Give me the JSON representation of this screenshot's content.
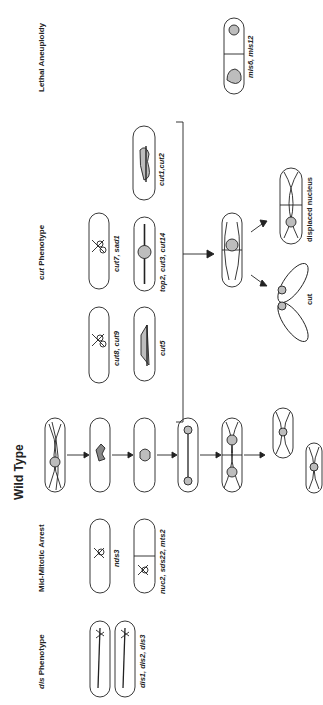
{
  "figure": {
    "columns": {
      "lethal_aneuploidy": "Lethal Aneuploidy",
      "cut_phenotype_italic": "cut",
      "cut_phenotype_rest": " Phenotype",
      "wild_type": "Wild Type",
      "mid_mitotic_arrest": "Mid-Mitotic Arrest",
      "dis_phenotype_italic": "dis",
      "dis_phenotype_rest": " Phenotype"
    },
    "mutant_labels": {
      "mis": "mis6, mis12",
      "cut1": "cut1,cut2",
      "cut7": "cut7, sad1",
      "top2": "top2, cut3, cut14",
      "cut8": "cut8, cut9",
      "cut5": "cut5",
      "nds3": "nds3",
      "nuc2": "nuc2, sds22, mts2",
      "dis": "dis1, dis2, dis3"
    },
    "outcomes": {
      "displaced": "displaced nucleus",
      "cut": "cut"
    },
    "colors": {
      "line": "#222222",
      "nucleus_fill": "#bdbdbd"
    }
  }
}
